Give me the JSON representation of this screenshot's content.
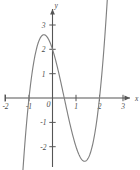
{
  "chart_data": {
    "type": "line",
    "title": "",
    "subtitle": "",
    "xlabel": "x",
    "ylabel": "y",
    "xlim": [
      -2.3,
      3.4
    ],
    "ylim": [
      -3.0,
      3.3
    ],
    "grid": false,
    "legend": null,
    "axis_style": "arrow-tipped cartesian axes through origin",
    "curve_color": "#808080",
    "axis_color": "#555555",
    "background_color": "#ffffff",
    "x_ticks": [
      -2,
      -1,
      1,
      2,
      3
    ],
    "x_tick_labels": [
      "-2",
      "-1",
      "1",
      "2",
      "3"
    ],
    "y_ticks": [
      -2,
      -1,
      1,
      2,
      3
    ],
    "y_tick_labels": [
      "-2",
      "-1",
      "1",
      "2",
      "3"
    ],
    "origin_label": "0",
    "series": [
      {
        "name": "cubic",
        "expression": "y = 2(x+1)(x-0.5)(x-2)",
        "roots": [
          -1,
          0.5,
          2
        ],
        "y_intercept": 2,
        "local_max": {
          "x": -0.4,
          "y": 2.55
        },
        "local_min": {
          "x": 1.45,
          "y": -2.65
        },
        "x": [
          -1.35,
          -1.3,
          -1.2,
          -1.1,
          -1.0,
          -0.9,
          -0.8,
          -0.7,
          -0.6,
          -0.5,
          -0.4,
          -0.3,
          -0.2,
          -0.1,
          0.0,
          0.1,
          0.2,
          0.3,
          0.4,
          0.5,
          0.6,
          0.7,
          0.8,
          0.9,
          1.0,
          1.1,
          1.2,
          1.3,
          1.4,
          1.5,
          1.6,
          1.7,
          1.8,
          1.9,
          2.0,
          2.1,
          2.2,
          2.3,
          2.4
        ],
        "y": [
          -3.02,
          -2.58,
          -1.79,
          -1.08,
          -0.45,
          0.09,
          0.56,
          0.95,
          1.27,
          1.5,
          1.68,
          1.79,
          1.87,
          1.92,
          2.0,
          1.88,
          1.76,
          1.58,
          1.36,
          1.12,
          0.85,
          0.56,
          0.27,
          -0.03,
          -0.31,
          -0.58,
          -0.82,
          -1.02,
          -1.19,
          -1.3,
          -1.36,
          -1.35,
          -1.26,
          -1.09,
          -0.83,
          -0.48,
          -0.02,
          0.55,
          1.25
        ]
      }
    ]
  }
}
